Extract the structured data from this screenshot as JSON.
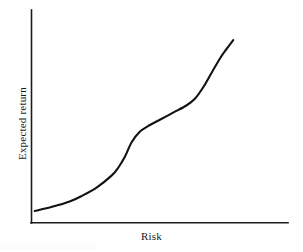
{
  "chart_data": {
    "type": "line",
    "title": "",
    "xlabel": "Risk",
    "ylabel": "Expected return",
    "grid": false,
    "legend": false,
    "xlim": [
      0,
      1
    ],
    "ylim": [
      0,
      1
    ],
    "axis_ticks": {
      "x": [],
      "y": []
    },
    "axes_style": "open-L",
    "series": [
      {
        "name": "risk-return curve",
        "shape": "s-curve",
        "color": "#121212",
        "points": [
          {
            "x": 0.008,
            "y": 0.033
          },
          {
            "x": 0.09,
            "y": 0.056
          },
          {
            "x": 0.175,
            "y": 0.087
          },
          {
            "x": 0.23,
            "y": 0.117
          },
          {
            "x": 0.3,
            "y": 0.164
          },
          {
            "x": 0.37,
            "y": 0.23
          },
          {
            "x": 0.4,
            "y": 0.272
          },
          {
            "x": 0.432,
            "y": 0.334
          },
          {
            "x": 0.463,
            "y": 0.413
          },
          {
            "x": 0.5,
            "y": 0.47
          },
          {
            "x": 0.54,
            "y": 0.502
          },
          {
            "x": 0.6,
            "y": 0.54
          },
          {
            "x": 0.66,
            "y": 0.578
          },
          {
            "x": 0.72,
            "y": 0.616
          },
          {
            "x": 0.76,
            "y": 0.653
          },
          {
            "x": 0.8,
            "y": 0.718
          },
          {
            "x": 0.84,
            "y": 0.8
          },
          {
            "x": 0.88,
            "y": 0.88
          },
          {
            "x": 0.91,
            "y": 0.93
          },
          {
            "x": 0.94,
            "y": 0.977
          }
        ]
      }
    ],
    "annotations": []
  },
  "labels": {
    "x_axis": "Risk",
    "y_axis": "Expected return"
  },
  "colors": {
    "curve": "#121212",
    "axis": "#1c1c1c",
    "background": "#ffffff"
  }
}
